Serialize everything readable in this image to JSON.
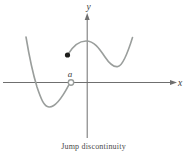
{
  "figure": {
    "caption": "Jump discontinuity",
    "labels": {
      "y_axis": "y",
      "x_axis": "x",
      "point": "a"
    },
    "colors": {
      "background": "#ffffff",
      "curve": "#9a9e9c",
      "axis": "#6f6f6f",
      "dot_fill": "#1d1d1b",
      "open_circle_fill": "#ffffff",
      "label_text": "#3c3c3c"
    }
  }
}
